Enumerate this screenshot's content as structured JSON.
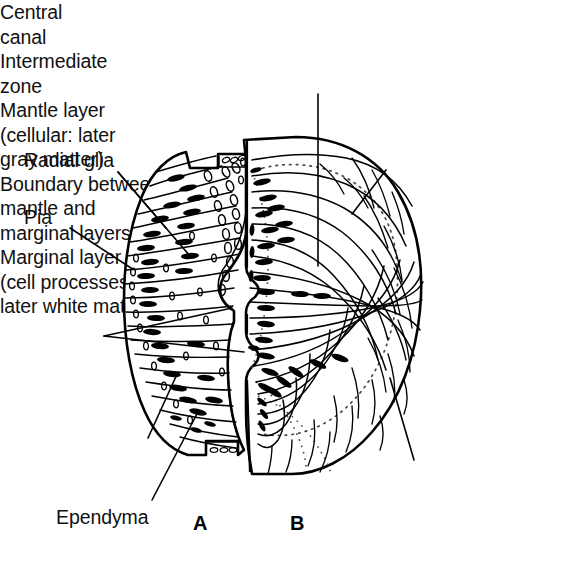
{
  "figure": {
    "panels": [
      {
        "id": "A",
        "letter": "A",
        "description": "Early neural tube wall showing radial glia, ependyma, intermediate zone, pia and central canal"
      },
      {
        "id": "B",
        "letter": "B",
        "description": "Later neural tube wall showing mantle layer, marginal layer and the boundary between them"
      }
    ],
    "colors": {
      "ink": "#000000",
      "background": "#ffffff",
      "dotted_boundary": "#555555"
    }
  },
  "labels": {
    "radial_glia": "Radial glia",
    "pia": "Pia",
    "central_canal_line1": "Central",
    "central_canal_line2": "canal",
    "intermediate_zone_line1": "Intermediate",
    "intermediate_zone_line2": "zone",
    "ependyma": "Ependyma",
    "mantle_layer_line1": "Mantle layer",
    "mantle_layer_line2": "(cellular: later",
    "mantle_layer_line3": "gray matter)",
    "boundary_line1": "Boundary between",
    "boundary_line2": "mantle and",
    "boundary_line3": "marginal layers",
    "marginal_layer_line1": "Marginal layer",
    "marginal_layer_line2": "(cell processes:",
    "marginal_layer_line3": "later white matter)",
    "panel_a_letter": "A",
    "panel_b_letter": "B"
  },
  "icons": {
    "leader_line": "leader-line",
    "dotted_boundary": "dotted-boundary-curve",
    "radial_glia_cell": "spindle-cell-glyph",
    "ependymal_cell": "oval-cell-glyph"
  }
}
